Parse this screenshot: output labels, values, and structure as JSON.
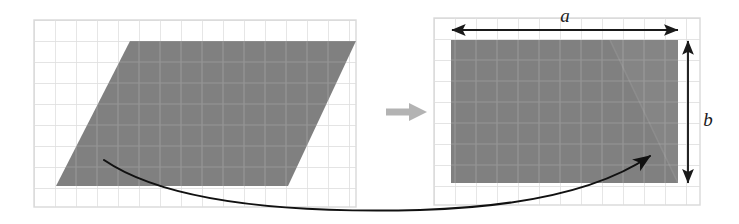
{
  "figure": {
    "background_color": "#ffffff",
    "shape_fill": "#808080",
    "grid_line_color": "#d9d9d9",
    "arrow_color": "#1a1a1a",
    "transform_arrow_color": "#b3b3b3"
  },
  "left_panel": {
    "name": "parallelogram-grid",
    "grid": {
      "x": 34,
      "y": 20,
      "width": 322,
      "height": 187,
      "cell_size": 21,
      "columns": 15,
      "rows": 9
    },
    "shape": {
      "type": "parallelogram",
      "points": "130,41 356,41 288,186 56,186"
    }
  },
  "transform_arrow": {
    "name": "transform-arrow",
    "glyph": "→",
    "x": 386,
    "y": 112
  },
  "right_panel": {
    "name": "rectangle-grid",
    "grid": {
      "x": 434,
      "y": 18,
      "width": 266,
      "height": 187,
      "cell_size": 21,
      "columns": 12,
      "rows": 9
    },
    "shape": {
      "type": "rectangle",
      "x": 451,
      "y": 40,
      "width": 227,
      "height": 143
    },
    "seam": {
      "description": "faint diagonal seam where the cut triangle was reattached",
      "points": "610,40 678,40 678,183"
    }
  },
  "dimensions": {
    "width_label": "a",
    "height_label": "b",
    "width_arrow": {
      "x1": 452,
      "x2": 678,
      "y": 30
    },
    "height_arrow": {
      "x": 688,
      "y1": 41,
      "y2": 183
    },
    "width_label_pos": {
      "x": 565,
      "y": 21
    },
    "height_label_pos": {
      "x": 706,
      "y": 120
    }
  },
  "motion_arrow": {
    "name": "triangle-motion-arrow",
    "description": "curved arrow showing the cut triangle sliding from the left shape to the right shape",
    "start": {
      "x": 104,
      "y": 160
    },
    "end": {
      "x": 650,
      "y": 155
    },
    "path": "M 104,160 C 170,205 300,213 420,210 C 520,207 600,190 650,156"
  }
}
